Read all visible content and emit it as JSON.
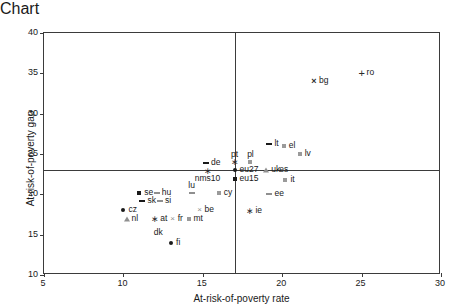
{
  "chart_data": {
    "type": "scatter",
    "title": "",
    "xlabel": "At-risk-of-poverty rate",
    "ylabel": "At-risk-of-poverty gap",
    "xlim": [
      5,
      30
    ],
    "ylim": [
      10,
      40
    ],
    "xticks": [
      5,
      10,
      15,
      20,
      25,
      30
    ],
    "yticks": [
      10,
      15,
      20,
      25,
      30,
      35,
      40
    ],
    "grid": false,
    "legend": "none",
    "reference_lines": [
      {
        "axis": "x",
        "value": 17,
        "label": "EU27 at-risk-of-poverty rate"
      },
      {
        "axis": "y",
        "value": 23,
        "label": "EU27 at-risk-of-poverty gap"
      }
    ],
    "points": [
      {
        "label": "cz",
        "x": 10.0,
        "y": 18.0,
        "marker": "dot",
        "label_pos": "right"
      },
      {
        "label": "nl",
        "x": 10.2,
        "y": 17.0,
        "marker": "tri",
        "label_pos": "right"
      },
      {
        "label": "se",
        "x": 11.0,
        "y": 20.2,
        "marker": "sq",
        "label_pos": "right"
      },
      {
        "label": "sk",
        "x": 11.2,
        "y": 19.2,
        "marker": "dash",
        "label_pos": "right"
      },
      {
        "label": "hu",
        "x": 12.1,
        "y": 20.2,
        "marker": "dash-lt",
        "label_pos": "right"
      },
      {
        "label": "si",
        "x": 12.3,
        "y": 19.2,
        "marker": "dash-lt",
        "label_pos": "right"
      },
      {
        "label": "at",
        "x": 12.0,
        "y": 17.0,
        "marker": "star",
        "label_pos": "right"
      },
      {
        "label": "dk",
        "x": 12.2,
        "y": 16.2,
        "marker": "none",
        "label_pos": "below"
      },
      {
        "label": "fr",
        "x": 13.1,
        "y": 17.0,
        "marker": "x-small",
        "label_pos": "right"
      },
      {
        "label": "fi",
        "x": 13.0,
        "y": 14.0,
        "marker": "dot",
        "label_pos": "right"
      },
      {
        "label": "mt",
        "x": 14.1,
        "y": 17.0,
        "marker": "sq-open",
        "label_pos": "right"
      },
      {
        "label": "lu",
        "x": 14.3,
        "y": 20.2,
        "marker": "dash-lt",
        "label_pos": "above"
      },
      {
        "label": "be",
        "x": 14.8,
        "y": 18.0,
        "marker": "x-small",
        "label_pos": "right"
      },
      {
        "label": "de",
        "x": 15.2,
        "y": 23.9,
        "marker": "dash",
        "label_pos": "right"
      },
      {
        "label": "nms10",
        "x": 15.3,
        "y": 22.9,
        "marker": "star",
        "label_pos": "below"
      },
      {
        "label": "cy",
        "x": 16.0,
        "y": 20.2,
        "marker": "sq-open",
        "label_pos": "right"
      },
      {
        "label": "pt",
        "x": 17.0,
        "y": 24.0,
        "marker": "star",
        "label_pos": "above"
      },
      {
        "label": "eu27",
        "x": 17.0,
        "y": 23.0,
        "marker": "dot",
        "label_pos": "right"
      },
      {
        "label": "eu15",
        "x": 17.0,
        "y": 21.9,
        "marker": "sq",
        "label_pos": "right"
      },
      {
        "label": "pl",
        "x": 18.0,
        "y": 24.0,
        "marker": "sq-open",
        "label_pos": "above"
      },
      {
        "label": "ie",
        "x": 18.0,
        "y": 17.9,
        "marker": "star",
        "label_pos": "right"
      },
      {
        "label": "uk",
        "x": 19.0,
        "y": 23.0,
        "marker": "tri",
        "label_pos": "right"
      },
      {
        "label": "lt",
        "x": 19.2,
        "y": 26.3,
        "marker": "dash",
        "label_pos": "right"
      },
      {
        "label": "ee",
        "x": 19.2,
        "y": 20.1,
        "marker": "dash-lt",
        "label_pos": "right"
      },
      {
        "label": "el",
        "x": 20.1,
        "y": 26.0,
        "marker": "sq-open",
        "label_pos": "right"
      },
      {
        "label": "es",
        "x": 20.1,
        "y": 24.0,
        "marker": "none",
        "label_pos": "below"
      },
      {
        "label": "it",
        "x": 20.2,
        "y": 21.8,
        "marker": "sq-open",
        "label_pos": "right"
      },
      {
        "label": "lv",
        "x": 21.1,
        "y": 25.0,
        "marker": "sq-open",
        "label_pos": "right"
      },
      {
        "label": "bg",
        "x": 22.0,
        "y": 34.1,
        "marker": "x",
        "label_pos": "right"
      },
      {
        "label": "ro",
        "x": 25.0,
        "y": 35.0,
        "marker": "plus",
        "label_pos": "right"
      }
    ]
  }
}
